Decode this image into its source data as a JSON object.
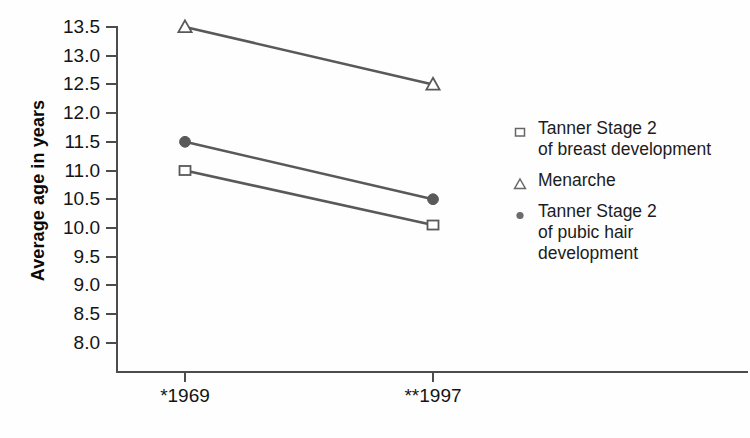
{
  "chart_data": {
    "type": "line",
    "title": "",
    "subtitle": "",
    "xlabel": "",
    "ylabel": "Average age in years",
    "categories": [
      "*1969",
      "**1997"
    ],
    "x_tick_labels": [
      "*1969",
      "**1997"
    ],
    "y_tick_labels": [
      "13.5",
      "13.0",
      "12.5",
      "12.0",
      "11.5",
      "11.0",
      "10.5",
      "10.0",
      "9.5",
      "9.0",
      "8.5",
      "8.0"
    ],
    "y_tick_values": [
      13.5,
      13.0,
      12.5,
      12.0,
      11.5,
      11.0,
      10.5,
      10.0,
      9.5,
      9.0,
      8.5,
      8.0
    ],
    "ylim": [
      7.7,
      13.6
    ],
    "grid": false,
    "legend_position": "right",
    "series": [
      {
        "name": "Tanner Stage 2\nof breast development",
        "marker": "open-square",
        "color": "#595959",
        "values": [
          11.0,
          10.05
        ]
      },
      {
        "name": "Menarche",
        "marker": "open-triangle",
        "color": "#595959",
        "values": [
          13.5,
          12.5
        ]
      },
      {
        "name": "Tanner Stage 2\nof pubic hair development",
        "marker": "filled-circle",
        "color": "#595959",
        "values": [
          11.5,
          10.5
        ]
      }
    ]
  },
  "axis": {
    "y_title": "Average age in years",
    "y_labels": [
      "13.5",
      "13.0",
      "12.5",
      "12.0",
      "11.5",
      "11.0",
      "10.5",
      "10.0",
      "9.5",
      "9.0",
      "8.5",
      "8.0"
    ],
    "x_labels": [
      "*1969",
      "**1997"
    ],
    "line_color": "#4c4c4c"
  },
  "legend": {
    "items": [
      {
        "marker": "open-square-icon",
        "label": "Tanner Stage 2\nof breast development"
      },
      {
        "marker": "open-triangle-icon",
        "label": "Menarche"
      },
      {
        "marker": "filled-circle-icon",
        "label": "Tanner Stage 2\nof pubic hair\ndevelopment"
      }
    ]
  },
  "colors": {
    "series": "#595959",
    "axis": "#4c4c4c",
    "text": "#141414",
    "background": "#fefefe"
  }
}
